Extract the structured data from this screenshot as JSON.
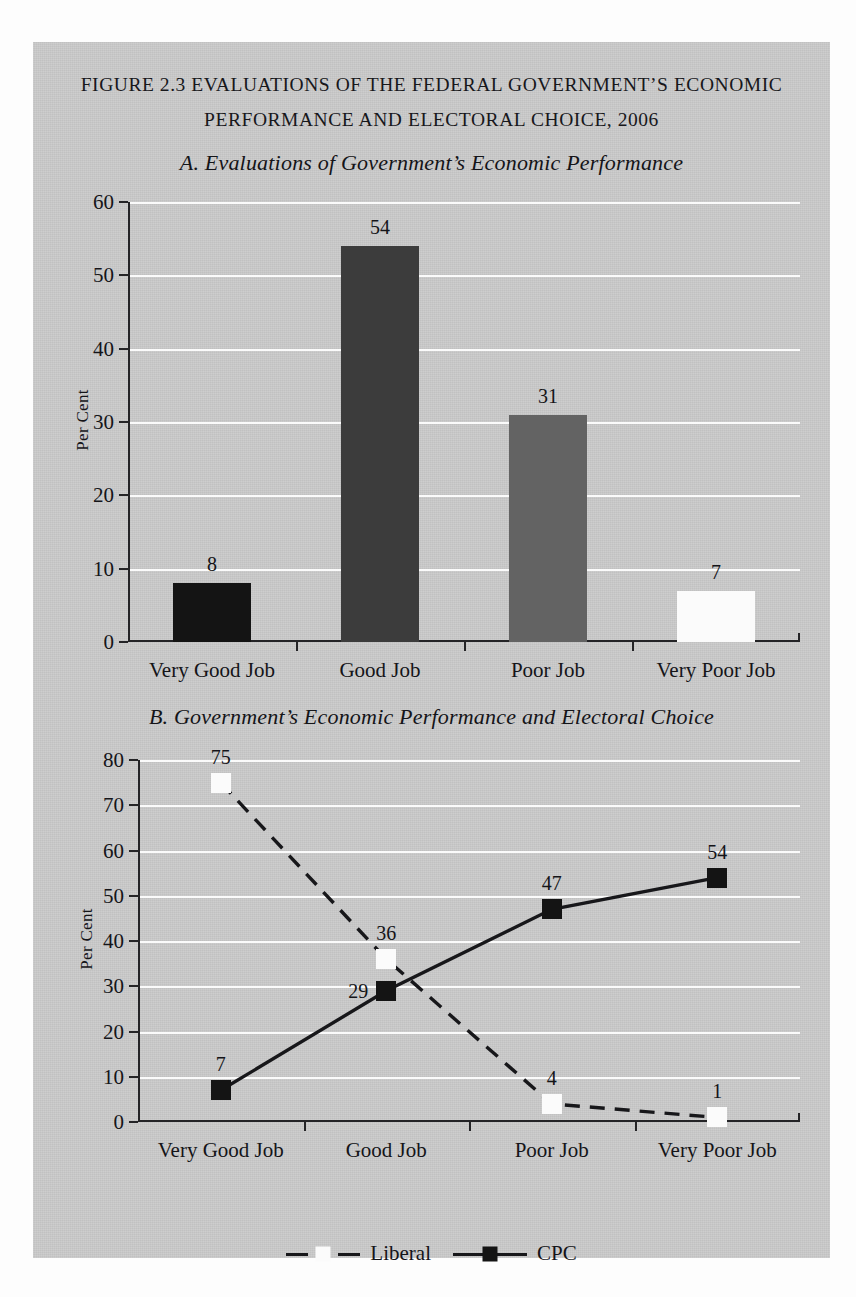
{
  "figure": {
    "title_line1": "FIGURE 2.3 EVALUATIONS OF THE FEDERAL GOVERNMENT’S ECONOMIC",
    "title_line2": "PERFORMANCE AND ELECTORAL CHOICE, 2006",
    "panel_a_subtitle": "A. Evaluations of Government’s Economic Performance",
    "panel_b_subtitle": "B. Government’s Economic Performance and Electoral Choice"
  },
  "colors": {
    "panel_background": "#c9c9c9",
    "gridline": "#fbfbfb",
    "axis": "#232326",
    "text": "#141418",
    "bar_very_good_job": "#141414",
    "bar_good_job": "#3c3c3c",
    "bar_poor_job": "#636363",
    "bar_very_poor_job": "#fbfbfb",
    "liberal_marker": "#fbfbfb",
    "cpc_marker": "#141414",
    "series_line": "#17171a"
  },
  "chart_data": [
    {
      "id": "panel-a",
      "type": "bar",
      "title": "A. Evaluations of Government’s Economic Performance",
      "xlabel": "",
      "ylabel": "Per Cent",
      "ylim": [
        0,
        60
      ],
      "yticks": [
        0,
        10,
        20,
        30,
        40,
        50,
        60
      ],
      "grid": true,
      "legend": false,
      "categories": [
        "Very Good Job",
        "Good Job",
        "Poor Job",
        "Very Poor Job"
      ],
      "values": [
        8,
        54,
        31,
        7
      ],
      "bar_colors": [
        "#141414",
        "#3c3c3c",
        "#636363",
        "#fbfbfb"
      ]
    },
    {
      "id": "panel-b",
      "type": "line",
      "title": "B. Government’s Economic Performance and Electoral Choice",
      "xlabel": "",
      "ylabel": "Per Cent",
      "ylim": [
        0,
        80
      ],
      "yticks": [
        0,
        10,
        20,
        30,
        40,
        50,
        60,
        70,
        80
      ],
      "grid": true,
      "legend": true,
      "legend_position": "bottom",
      "categories": [
        "Very Good Job",
        "Good Job",
        "Poor Job",
        "Very Poor Job"
      ],
      "series": [
        {
          "name": "Liberal",
          "values": [
            75,
            36,
            4,
            1
          ],
          "line_style": "dashed",
          "marker": "square",
          "marker_color": "#fbfbfb",
          "line_color": "#17171a",
          "label_positions": [
            "above",
            "above",
            "above",
            "above"
          ]
        },
        {
          "name": "CPC",
          "values": [
            7,
            29,
            47,
            54
          ],
          "line_style": "solid",
          "marker": "square",
          "marker_color": "#141414",
          "line_color": "#17171a",
          "label_positions": [
            "above",
            "left",
            "above",
            "above"
          ]
        }
      ]
    }
  ],
  "legend": {
    "items": [
      {
        "label": "Liberal",
        "style": "dashed",
        "marker_color": "#fbfbfb"
      },
      {
        "label": "CPC",
        "style": "solid",
        "marker_color": "#141414"
      }
    ]
  }
}
